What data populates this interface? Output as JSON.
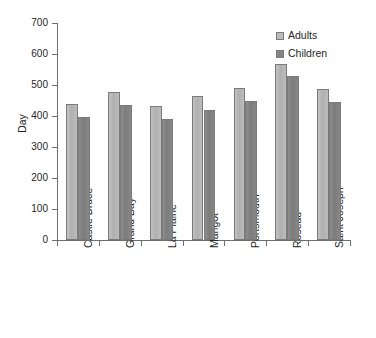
{
  "chart_data": {
    "type": "bar",
    "title": "",
    "xlabel": "",
    "ylabel": "Day",
    "ylim": [
      0,
      700
    ],
    "yticks": [
      0,
      100,
      200,
      300,
      400,
      500,
      600,
      700
    ],
    "grid": false,
    "legend_position": "top-right",
    "categories": [
      "Castle Bruce",
      "Grand Bay",
      "La Plaine",
      "Marigot",
      "Portsmouth",
      "Roseau",
      "Saint Joseph"
    ],
    "series": [
      {
        "name": "Adults",
        "color": "#bcbcbc",
        "values": [
          439,
          478,
          431,
          463,
          490,
          568,
          487
        ]
      },
      {
        "name": "Children",
        "color": "#848484",
        "values": [
          398,
          436,
          389,
          420,
          450,
          528,
          445
        ]
      }
    ]
  },
  "axis": {
    "y_title": "Day",
    "tick_labels": [
      "0",
      "100",
      "200",
      "300",
      "400",
      "500",
      "600",
      "700"
    ]
  },
  "legend": {
    "items": [
      {
        "label": "Adults",
        "color": "#bcbcbc"
      },
      {
        "label": "Children",
        "color": "#848484"
      }
    ]
  },
  "colors": {
    "adults": "#bcbcbc",
    "children": "#848484",
    "axis": "#6e6e6e",
    "text": "#262626",
    "background": "#ffffff"
  }
}
